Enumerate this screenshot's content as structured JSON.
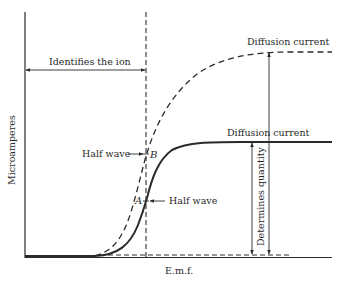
{
  "diagram": {
    "axes": {
      "y_label": "Microamperes",
      "x_label": "E.m.f."
    },
    "annotations": {
      "identifies_ion": "Identifies the ion",
      "diffusion_current_upper": "Diffusion current",
      "diffusion_current_lower": "Diffusion current",
      "half_wave_b": "Half wave",
      "half_wave_a": "Half wave",
      "determines_quantity": "Determines quantity",
      "point_a": "A",
      "point_b": "B"
    },
    "curves": [
      {
        "name": "dashed-wave",
        "style": "dashed",
        "plateau": "upper",
        "half_wave_point": "B"
      },
      {
        "name": "solid-wave",
        "style": "solid",
        "plateau": "lower",
        "half_wave_point": "A"
      }
    ],
    "colors": {
      "ink": "#2a2a2a",
      "background": "#ffffff"
    }
  }
}
